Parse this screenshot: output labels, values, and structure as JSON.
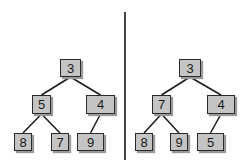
{
  "diagram": {
    "colors": {
      "node_fill": "#c4c4c4",
      "node_border": "#2a2a2a",
      "edge": "#1a1a1a",
      "divider": "#444444"
    },
    "trees": [
      {
        "name": "left",
        "nodes": [
          {
            "id": "L0",
            "label": "3",
            "x": 60,
            "y": 59,
            "w": 21,
            "h": 18
          },
          {
            "id": "L1",
            "label": "5",
            "x": 32,
            "y": 95,
            "w": 19,
            "h": 19
          },
          {
            "id": "L2",
            "label": "4",
            "x": 86,
            "y": 95,
            "w": 29,
            "h": 19
          },
          {
            "id": "L3",
            "label": "8",
            "x": 14,
            "y": 133,
            "w": 18,
            "h": 18
          },
          {
            "id": "L4",
            "label": "7",
            "x": 51,
            "y": 133,
            "w": 18,
            "h": 18
          },
          {
            "id": "L5",
            "label": "9",
            "x": 77,
            "y": 133,
            "w": 27,
            "h": 18
          }
        ],
        "edges": [
          [
            "L0",
            "L1"
          ],
          [
            "L0",
            "L2"
          ],
          [
            "L1",
            "L3"
          ],
          [
            "L1",
            "L4"
          ],
          [
            "L2",
            "L5"
          ]
        ]
      },
      {
        "name": "right",
        "nodes": [
          {
            "id": "R0",
            "label": "3",
            "x": 179,
            "y": 59,
            "w": 22,
            "h": 18
          },
          {
            "id": "R1",
            "label": "7",
            "x": 152,
            "y": 95,
            "w": 19,
            "h": 19
          },
          {
            "id": "R2",
            "label": "4",
            "x": 207,
            "y": 95,
            "w": 28,
            "h": 19
          },
          {
            "id": "R3",
            "label": "8",
            "x": 135,
            "y": 133,
            "w": 18,
            "h": 18
          },
          {
            "id": "R4",
            "label": "9",
            "x": 170,
            "y": 133,
            "w": 18,
            "h": 18
          },
          {
            "id": "R5",
            "label": "5",
            "x": 197,
            "y": 133,
            "w": 27,
            "h": 18
          }
        ],
        "edges": [
          [
            "R0",
            "R1"
          ],
          [
            "R0",
            "R2"
          ],
          [
            "R1",
            "R3"
          ],
          [
            "R1",
            "R4"
          ],
          [
            "R2",
            "R5"
          ]
        ]
      }
    ]
  }
}
